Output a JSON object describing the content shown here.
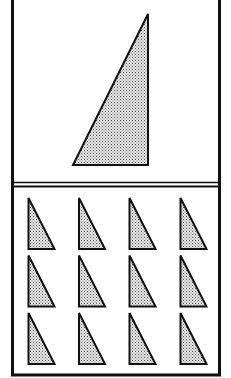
{
  "figure": {
    "width": 231,
    "height": 378,
    "colors": {
      "background": "#ffffff",
      "stroke": "#111111",
      "fill": "#d8d8d8",
      "dot": "#555555"
    },
    "frame": {
      "left": 12.5,
      "right": 219.5,
      "top": -2,
      "bottom": 375,
      "stroke_width": 3
    },
    "divider": {
      "y1": 182.5,
      "y2": 186.5,
      "stroke_width": 1.5
    },
    "top_panel": {
      "shape": "right-triangle",
      "vertices": [
        [
          148,
          14
        ],
        [
          73,
          165
        ],
        [
          148,
          165
        ]
      ]
    },
    "bottom_panel": {
      "shape": "right-triangle",
      "rows": 3,
      "columns": 4,
      "column_x": [
        28.5,
        79,
        129.5,
        180.5
      ],
      "row_top_y": [
        198,
        255.5,
        313
      ],
      "triangle_width": 26,
      "triangle_height": 51
    }
  }
}
